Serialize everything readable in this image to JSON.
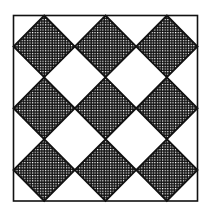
{
  "figure": {
    "title": "",
    "grid": {
      "rows": 3,
      "cols": 3
    },
    "diamond_fill": "crosshatch",
    "colors": {
      "ink": "#111111",
      "paper": "#ffffff"
    }
  }
}
